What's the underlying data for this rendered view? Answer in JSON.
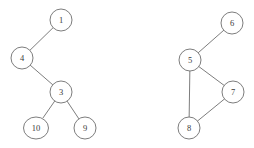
{
  "figure": {
    "type": "graph-diagram",
    "background_color": "#ffffff",
    "stroke_color": "#6e6e6e",
    "label_color": "#3a3a3a",
    "width": 254,
    "height": 148
  },
  "graph": {
    "directed": false,
    "components": [
      {
        "name": "left-component",
        "node_ids": [
          "1",
          "4",
          "3",
          "10",
          "9"
        ]
      },
      {
        "name": "right-component",
        "node_ids": [
          "6",
          "5",
          "7",
          "8"
        ]
      }
    ],
    "nodes": [
      {
        "id": "1",
        "label": "1",
        "cx": 61,
        "cy": 20,
        "r": 11,
        "rx": 11,
        "component": "left-component"
      },
      {
        "id": "4",
        "label": "4",
        "cx": 22,
        "cy": 58,
        "r": 11,
        "rx": 11,
        "component": "left-component"
      },
      {
        "id": "3",
        "label": "3",
        "cx": 61,
        "cy": 92,
        "r": 11,
        "rx": 11,
        "component": "left-component"
      },
      {
        "id": "10",
        "label": "10",
        "cx": 36,
        "cy": 128,
        "r": 11,
        "rx": 12.5,
        "component": "left-component"
      },
      {
        "id": "9",
        "label": "9",
        "cx": 85,
        "cy": 128,
        "r": 11,
        "rx": 11,
        "component": "left-component"
      },
      {
        "id": "6",
        "label": "6",
        "cx": 232,
        "cy": 23,
        "r": 11,
        "rx": 11,
        "component": "right-component"
      },
      {
        "id": "5",
        "label": "5",
        "cx": 190,
        "cy": 60,
        "r": 11,
        "rx": 11,
        "component": "right-component"
      },
      {
        "id": "7",
        "label": "7",
        "cx": 233,
        "cy": 92,
        "r": 11,
        "rx": 11,
        "component": "right-component"
      },
      {
        "id": "8",
        "label": "8",
        "cx": 189,
        "cy": 128,
        "r": 11,
        "rx": 11,
        "component": "right-component"
      }
    ],
    "edges": [
      {
        "id": "edge-4-1",
        "source": "4",
        "target": "1"
      },
      {
        "id": "edge-4-3",
        "source": "4",
        "target": "3"
      },
      {
        "id": "edge-3-10",
        "source": "3",
        "target": "10"
      },
      {
        "id": "edge-3-9",
        "source": "3",
        "target": "9"
      },
      {
        "id": "edge-5-6",
        "source": "5",
        "target": "6"
      },
      {
        "id": "edge-5-7",
        "source": "5",
        "target": "7"
      },
      {
        "id": "edge-5-8",
        "source": "5",
        "target": "8"
      },
      {
        "id": "edge-7-8",
        "source": "7",
        "target": "8"
      }
    ]
  }
}
